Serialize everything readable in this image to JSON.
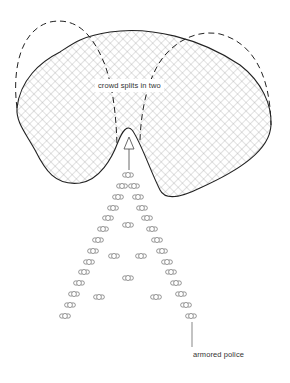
{
  "diagram": {
    "title": "",
    "labels": {
      "crowd": "crowd splits in two",
      "police": "armored police"
    },
    "colors": {
      "outline": "#222222",
      "hatch": "#9a9a9a",
      "background": "#ffffff",
      "text": "#333333"
    },
    "elements": [
      {
        "id": "crowd-area",
        "type": "cross-hatched region",
        "description": "crowd mass with a notch at bottom where the police wedge enters"
      },
      {
        "id": "split-left",
        "type": "dashed loop",
        "description": "left half of crowd moving away"
      },
      {
        "id": "split-right",
        "type": "dashed loop",
        "description": "right half of crowd moving away"
      },
      {
        "id": "push-arrow",
        "type": "arrow",
        "direction": "up",
        "description": "police wedge pushes into crowd"
      },
      {
        "id": "police-formation",
        "type": "V-shaped formation",
        "unit_count": 37
      }
    ],
    "police_units": [
      [
        128,
        175
      ],
      [
        122,
        186
      ],
      [
        134,
        186
      ],
      [
        118,
        197
      ],
      [
        138,
        197
      ],
      [
        113,
        208
      ],
      [
        142,
        208
      ],
      [
        108,
        218
      ],
      [
        147,
        218
      ],
      [
        128,
        225
      ],
      [
        103,
        229
      ],
      [
        152,
        229
      ],
      [
        98,
        240
      ],
      [
        157,
        240
      ],
      [
        93,
        251
      ],
      [
        162,
        251
      ],
      [
        114,
        256
      ],
      [
        141,
        256
      ],
      [
        89,
        262
      ],
      [
        167,
        262
      ],
      [
        84,
        272
      ],
      [
        171,
        272
      ],
      [
        128,
        278
      ],
      [
        79,
        283
      ],
      [
        176,
        283
      ],
      [
        74,
        294
      ],
      [
        181,
        294
      ],
      [
        99,
        297
      ],
      [
        156,
        297
      ],
      [
        70,
        305
      ],
      [
        186,
        305
      ],
      [
        65,
        316
      ],
      [
        191,
        316
      ]
    ]
  }
}
